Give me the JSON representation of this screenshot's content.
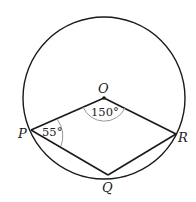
{
  "diagram": {
    "type": "circle-geometry",
    "points": {
      "O": {
        "label": "O",
        "x": 104,
        "y": 98
      },
      "P": {
        "label": "P",
        "x": 31,
        "y": 130
      },
      "Q": {
        "label": "Q",
        "x": 108,
        "y": 175
      },
      "R": {
        "label": "R",
        "x": 176,
        "y": 134
      }
    },
    "circle": {
      "cx": 104,
      "cy": 98,
      "r": 81
    },
    "angles": {
      "at_O": "150°",
      "at_P": "55°"
    },
    "colors": {
      "stroke": "#1a1a1a",
      "arc": "#999999"
    }
  }
}
